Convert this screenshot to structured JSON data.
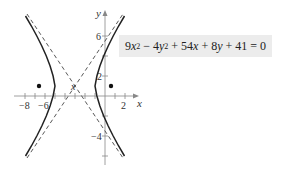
{
  "equation": {
    "parts": [
      "9",
      "x",
      "2",
      " − 4",
      "y",
      "2",
      " + 54",
      "x",
      " + 8",
      "y",
      " + 41 = 0"
    ],
    "text": "9x^2 − 4y^2 + 54x + 8y + 41 = 0",
    "background": "#ececec"
  },
  "graph": {
    "x_axis_label": "x",
    "y_axis_label": "y",
    "x_tick_labels": [
      "−8",
      "−6",
      "2"
    ],
    "y_tick_labels": [
      "6",
      "2",
      "−4"
    ],
    "center_marker": "x",
    "center": [
      -3,
      1
    ],
    "vertices": [
      [
        -5,
        1
      ],
      [
        -1,
        1
      ]
    ],
    "foci": [
      [
        -6.6,
        1
      ],
      [
        0.6,
        1
      ]
    ],
    "asymptote_slope": 1.5,
    "curve_color": "#222222",
    "asymptote_style": "dashed"
  }
}
